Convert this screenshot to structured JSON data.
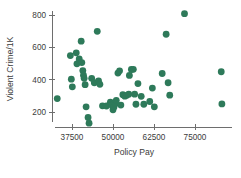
{
  "chart_data": {
    "type": "scatter",
    "title": "",
    "xlabel": "Policy Pay",
    "ylabel": "Violent Crime/1K",
    "xlim": [
      30000,
      85500
    ],
    "ylim": [
      100,
      830
    ],
    "xticks": [
      37500,
      50000,
      62500,
      75000
    ],
    "xtick_labels": [
      "37500",
      "50000",
      "62500",
      "75000"
    ],
    "yticks": [
      200,
      400,
      600,
      800
    ],
    "ytick_labels": [
      "200",
      "400",
      "600",
      "800"
    ],
    "grid": false,
    "legend": null,
    "marker_color": "#2e7a5a",
    "marker_size": 3.4,
    "axis_color": "#6e6e6e",
    "text_color": "#3b3b3b",
    "background": "#ffffff",
    "points": [
      {
        "x": 33000,
        "y": 283
      },
      {
        "x": 37000,
        "y": 549
      },
      {
        "x": 37300,
        "y": 403
      },
      {
        "x": 37600,
        "y": 356
      },
      {
        "x": 38800,
        "y": 566
      },
      {
        "x": 39000,
        "y": 498
      },
      {
        "x": 39700,
        "y": 528
      },
      {
        "x": 40300,
        "y": 638
      },
      {
        "x": 40500,
        "y": 506
      },
      {
        "x": 40800,
        "y": 456
      },
      {
        "x": 41000,
        "y": 428
      },
      {
        "x": 41200,
        "y": 408
      },
      {
        "x": 41500,
        "y": 369
      },
      {
        "x": 41800,
        "y": 232
      },
      {
        "x": 42400,
        "y": 166
      },
      {
        "x": 42700,
        "y": 131
      },
      {
        "x": 43500,
        "y": 408
      },
      {
        "x": 44300,
        "y": 381
      },
      {
        "x": 45200,
        "y": 699
      },
      {
        "x": 45600,
        "y": 392
      },
      {
        "x": 46000,
        "y": 371
      },
      {
        "x": 46800,
        "y": 238
      },
      {
        "x": 48000,
        "y": 237
      },
      {
        "x": 49200,
        "y": 261
      },
      {
        "x": 49600,
        "y": 243
      },
      {
        "x": 50000,
        "y": 214
      },
      {
        "x": 50300,
        "y": 231
      },
      {
        "x": 50700,
        "y": 251
      },
      {
        "x": 51000,
        "y": 272
      },
      {
        "x": 51500,
        "y": 441
      },
      {
        "x": 52000,
        "y": 455
      },
      {
        "x": 52400,
        "y": 243
      },
      {
        "x": 53000,
        "y": 307
      },
      {
        "x": 53600,
        "y": 298
      },
      {
        "x": 54200,
        "y": 303
      },
      {
        "x": 54800,
        "y": 310
      },
      {
        "x": 55000,
        "y": 426
      },
      {
        "x": 55600,
        "y": 463
      },
      {
        "x": 56200,
        "y": 464
      },
      {
        "x": 56600,
        "y": 310
      },
      {
        "x": 57000,
        "y": 248
      },
      {
        "x": 57600,
        "y": 376
      },
      {
        "x": 58600,
        "y": 297
      },
      {
        "x": 59400,
        "y": 248
      },
      {
        "x": 61200,
        "y": 265
      },
      {
        "x": 62000,
        "y": 348
      },
      {
        "x": 62600,
        "y": 232
      },
      {
        "x": 65000,
        "y": 438
      },
      {
        "x": 66200,
        "y": 681
      },
      {
        "x": 66800,
        "y": 381
      },
      {
        "x": 67300,
        "y": 304
      },
      {
        "x": 71800,
        "y": 808
      },
      {
        "x": 83000,
        "y": 449
      },
      {
        "x": 83200,
        "y": 250
      }
    ]
  }
}
